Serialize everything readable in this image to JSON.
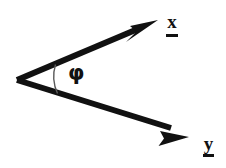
{
  "figure": {
    "type": "vector-angle-diagram",
    "background_color": "#ffffff",
    "stroke_color": "#111111",
    "width": 226,
    "height": 168,
    "vertex": {
      "x": 17,
      "y": 80
    },
    "vectors": [
      {
        "name": "x-vector",
        "label": "x",
        "notation": "underlined",
        "tip": {
          "x": 158,
          "y": 20
        },
        "label_position": {
          "x": 166,
          "y": 12
        }
      },
      {
        "name": "y-vector",
        "label": "y",
        "notation": "underlined",
        "tip": {
          "x": 189,
          "y": 137
        },
        "label_position": {
          "x": 203,
          "y": 134
        }
      }
    ],
    "angle": {
      "name": "phi-angle",
      "symbol": "φ",
      "arc_radius": 41,
      "label_position": {
        "x": 68,
        "y": 63
      }
    }
  }
}
